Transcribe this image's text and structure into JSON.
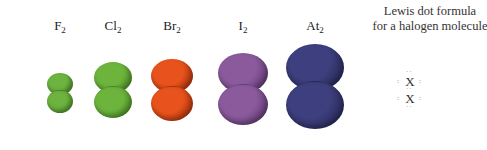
{
  "molecules": [
    {
      "symbol": "F",
      "subscript": "2",
      "color": "#6db33f",
      "dark": "#3e7a1e",
      "x": 60,
      "top": 73,
      "width": 26,
      "atomHeight": 22
    },
    {
      "symbol": "Cl",
      "subscript": "2",
      "color": "#6cb43c",
      "dark": "#3b7a1a",
      "x": 113,
      "top": 62,
      "width": 38,
      "atomHeight": 31
    },
    {
      "symbol": "Br",
      "subscript": "2",
      "color": "#e8521c",
      "dark": "#8a2408",
      "x": 172,
      "top": 59,
      "width": 42,
      "atomHeight": 34
    },
    {
      "symbol": "I",
      "subscript": "2",
      "color": "#8a5a9c",
      "dark": "#4e2a5e",
      "x": 243,
      "top": 53,
      "width": 50,
      "atomHeight": 40
    },
    {
      "symbol": "At",
      "subscript": "2",
      "color": "#3d3f7e",
      "dark": "#1b1c40",
      "x": 315,
      "top": 44,
      "width": 58,
      "atomHeight": 47
    }
  ],
  "caption": {
    "line1": "Lewis dot formula",
    "line2": "for a halogen molecule"
  },
  "lewis": {
    "atom": "X",
    "colon": ":"
  }
}
